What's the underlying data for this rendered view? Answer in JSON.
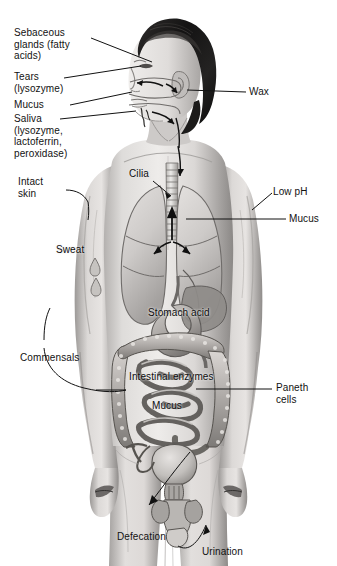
{
  "figure": {
    "organs": [
      "head",
      "nasal cavity",
      "mouth",
      "trachea",
      "left lung",
      "right lung",
      "heart",
      "liver",
      "stomach",
      "large intestine",
      "small intestine",
      "bladder",
      "penis",
      "testes",
      "arms",
      "legs"
    ]
  },
  "labels": {
    "sebaceous_glands": "Sebaceous\nglands (fatty\nacids)",
    "tears": "Tears\n(lysozyme)",
    "mucus_nose": "Mucus",
    "saliva": "Saliva\n(lysozyme,\nlactoferrin,\nperoxidase)",
    "intact_skin": "Intact\nskin",
    "sweat": "Sweat",
    "commensals": "Commensals",
    "cilia": "Cilia",
    "wax": "Wax",
    "low_ph": "Low pH",
    "mucus_lung": "Mucus",
    "stomach_acid": "Stomach acid",
    "intestinal_enzymes": "Intestinal enzymes",
    "mucus_gut": "Mucus",
    "paneth_cells": "Paneth\ncells",
    "defecation": "Defecation",
    "urination": "Urination"
  },
  "colors": {
    "background": "#ffffff",
    "ink": "#121212",
    "skin_light": "#e9e7e6",
    "skin_mid": "#c9c6c4",
    "skin_shadow": "#8d8a88",
    "hair_dark": "#1b1a1a",
    "organ_light": "#dedbd9",
    "organ_mid": "#a9a5a3",
    "organ_dark": "#6e6b69",
    "outline": "#4a4846"
  }
}
